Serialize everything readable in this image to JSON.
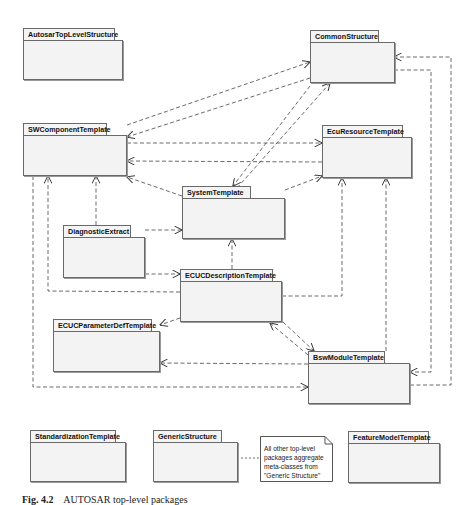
{
  "diagram": {
    "type": "UML package diagram",
    "packages": [
      {
        "id": "autosar-top-level-structure",
        "label": "AutosarTopLevelStructure"
      },
      {
        "id": "common-structure",
        "label": "CommonStructure"
      },
      {
        "id": "sw-component-template",
        "label": "SWComponentTemplate"
      },
      {
        "id": "ecu-resource-template",
        "label": "EcuResourceTemplate"
      },
      {
        "id": "system-template",
        "label": "SystemTemplate"
      },
      {
        "id": "diagnostic-extract",
        "label": "DiagnosticExtract"
      },
      {
        "id": "ecuc-description-template",
        "label": "ECUCDescriptionTemplate"
      },
      {
        "id": "ecuc-parameter-def-template",
        "label": "ECUCParameterDefTemplate"
      },
      {
        "id": "bsw-module-template",
        "label": "BswModuleTemplate"
      },
      {
        "id": "standardization-template",
        "label": "StandardizationTemplate"
      },
      {
        "id": "generic-structure",
        "label": "GenericStructure"
      },
      {
        "id": "feature-model-template",
        "label": "FeatureModelTemplate"
      }
    ],
    "note": {
      "lines": [
        "All other top-level",
        "packages aggregate",
        "meta-classes from",
        "\"Generic Structure\""
      ],
      "attached_to": "GenericStructure"
    },
    "dependencies": [
      {
        "from": "SWComponentTemplate",
        "to": "CommonStructure"
      },
      {
        "from": "SystemTemplate",
        "to": "CommonStructure"
      },
      {
        "from": "CommonStructure",
        "to": "SWComponentTemplate"
      },
      {
        "from": "CommonStructure",
        "to": "SystemTemplate"
      },
      {
        "from": "SWComponentTemplate",
        "to": "EcuResourceTemplate"
      },
      {
        "from": "EcuResourceTemplate",
        "to": "SWComponentTemplate"
      },
      {
        "from": "SystemTemplate",
        "to": "SWComponentTemplate"
      },
      {
        "from": "SystemTemplate",
        "to": "EcuResourceTemplate"
      },
      {
        "from": "DiagnosticExtract",
        "to": "SWComponentTemplate"
      },
      {
        "from": "DiagnosticExtract",
        "to": "SystemTemplate"
      },
      {
        "from": "DiagnosticExtract",
        "to": "ECUCDescriptionTemplate"
      },
      {
        "from": "ECUCDescriptionTemplate",
        "to": "SystemTemplate"
      },
      {
        "from": "ECUCDescriptionTemplate",
        "to": "SWComponentTemplate"
      },
      {
        "from": "ECUCDescriptionTemplate",
        "to": "EcuResourceTemplate"
      },
      {
        "from": "ECUCDescriptionTemplate",
        "to": "ECUCParameterDefTemplate"
      },
      {
        "from": "ECUCDescriptionTemplate",
        "to": "BswModuleTemplate"
      },
      {
        "from": "BswModuleTemplate",
        "to": "ECUCDescriptionTemplate"
      },
      {
        "from": "BswModuleTemplate",
        "to": "ECUCParameterDefTemplate"
      },
      {
        "from": "BswModuleTemplate",
        "to": "EcuResourceTemplate"
      },
      {
        "from": "BswModuleTemplate",
        "to": "CommonStructure"
      },
      {
        "from": "CommonStructure",
        "to": "BswModuleTemplate"
      },
      {
        "from": "SWComponentTemplate",
        "to": "BswModuleTemplate"
      }
    ]
  },
  "caption": {
    "number": "Fig. 4.2",
    "text": "AUTOSAR top-level packages"
  }
}
